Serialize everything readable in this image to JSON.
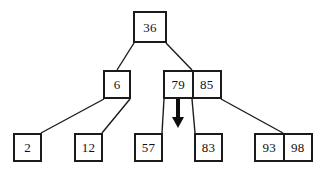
{
  "figure": {
    "kind": "b-tree-diagram",
    "background_color": "#ffffff",
    "stroke_color": "#1b1b1b",
    "fill_color": "#ffffff"
  },
  "nodes": [
    {
      "id": "root",
      "level": 0,
      "keys": [
        "36"
      ],
      "x": 133,
      "y": 11,
      "width": 34,
      "height": 32
    },
    {
      "id": "internal-left",
      "level": 1,
      "keys": [
        "6"
      ],
      "x": 103,
      "y": 70,
      "width": 28,
      "height": 29
    },
    {
      "id": "internal-right",
      "level": 1,
      "keys": [
        "79",
        "85"
      ],
      "x": 163,
      "y": 70,
      "width": 59,
      "height": 29
    },
    {
      "id": "leaf-1",
      "level": 2,
      "keys": [
        "2"
      ],
      "x": 13,
      "y": 133,
      "width": 29,
      "height": 29
    },
    {
      "id": "leaf-2",
      "level": 2,
      "keys": [
        "12"
      ],
      "x": 74,
      "y": 133,
      "width": 29,
      "height": 29
    },
    {
      "id": "leaf-3",
      "level": 2,
      "keys": [
        "57"
      ],
      "x": 134,
      "y": 133,
      "width": 29,
      "height": 29
    },
    {
      "id": "leaf-4",
      "level": 2,
      "keys": [
        "83"
      ],
      "x": 194,
      "y": 133,
      "width": 29,
      "height": 29
    },
    {
      "id": "leaf-5",
      "level": 2,
      "keys": [
        "93",
        "98"
      ],
      "x": 254,
      "y": 133,
      "width": 59,
      "height": 29
    }
  ],
  "edges": [
    {
      "id": "root-to-left",
      "x1": 134,
      "y1": 43,
      "x2": 117,
      "y2": 70
    },
    {
      "id": "root-to-right",
      "x1": 166,
      "y1": 43,
      "x2": 192,
      "y2": 70
    },
    {
      "id": "left-to-leaf-1",
      "x1": 104,
      "y1": 99,
      "x2": 41,
      "y2": 133
    },
    {
      "id": "left-to-leaf-2",
      "x1": 130,
      "y1": 99,
      "x2": 102,
      "y2": 133
    },
    {
      "id": "right-to-leaf-3",
      "x1": 164,
      "y1": 99,
      "x2": 162,
      "y2": 133
    },
    {
      "id": "right-to-leaf-4",
      "x1": 192,
      "y1": 99,
      "x2": 195,
      "y2": 133
    },
    {
      "id": "right-to-leaf-5",
      "x1": 221,
      "y1": 99,
      "x2": 283,
      "y2": 133
    }
  ],
  "arrow": {
    "id": "insert-pointer-arrow",
    "x": 178,
    "y_start": 99,
    "y_end": 128,
    "shaft_width": 4,
    "head_width": 12,
    "head_height": 11,
    "color": "#0d0d0d"
  }
}
